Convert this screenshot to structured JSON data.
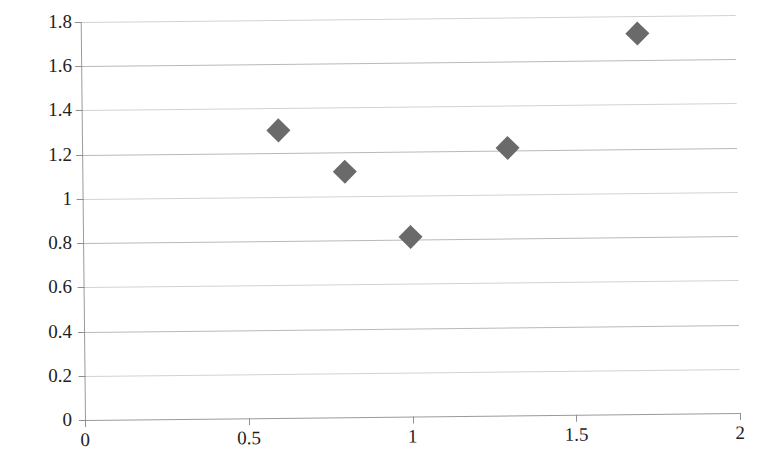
{
  "chart_data": {
    "type": "scatter",
    "title": "",
    "subtitle": "",
    "xlabel": "",
    "ylabel": "",
    "xlim": [
      0,
      2
    ],
    "ylim": [
      0,
      1.8
    ],
    "grid": true,
    "legend": false,
    "legend_position": "none",
    "marker": "diamond",
    "marker_color": "#6a6a6a",
    "gridline_color": "#b9b9b9",
    "axis_color": "#9a9a9a",
    "x_ticks": [
      0,
      0.5,
      1,
      1.5,
      2
    ],
    "x_tick_labels": [
      "0",
      "0.5",
      "1",
      "1.5",
      "2"
    ],
    "y_ticks": [
      0,
      0.2,
      0.4,
      0.6,
      0.8,
      1,
      1.2,
      1.4,
      1.6,
      1.8
    ],
    "y_tick_labels": [
      "0",
      "0.2",
      "0.4",
      "0.6",
      "0.8",
      "1",
      "1.2",
      "1.4",
      "1.6",
      "1.8"
    ],
    "series": [
      {
        "name": "series-1",
        "points": [
          {
            "x": 0.6,
            "y": 1.3
          },
          {
            "x": 0.8,
            "y": 1.11
          },
          {
            "x": 1.0,
            "y": 0.81
          },
          {
            "x": 1.3,
            "y": 1.21
          },
          {
            "x": 1.7,
            "y": 1.72
          }
        ]
      }
    ]
  }
}
